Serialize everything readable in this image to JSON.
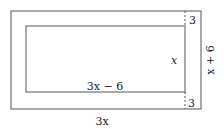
{
  "diagram": {
    "labels": {
      "inner_width": "3x − 6",
      "inner_height": "x",
      "outer_width": "3x",
      "outer_height": "x + 6",
      "top_gap": "3",
      "bottom_gap": "3"
    },
    "colors": {
      "stroke": "#555555",
      "text": "#222222",
      "background": "#ffffff"
    }
  }
}
